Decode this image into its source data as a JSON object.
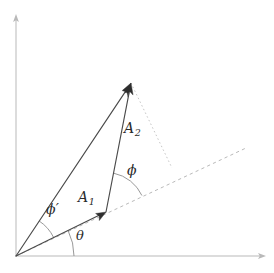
{
  "figure": {
    "type": "vector-diagram",
    "canvas": {
      "width": 274,
      "height": 273
    },
    "background_color": "#ffffff"
  },
  "colors": {
    "axis": "#b9b9b9",
    "vector": "#4a4a4a",
    "arrowhead": "#2e2e2e",
    "dashed_guide": "#b5b5b5",
    "dotted_guide": "#c2c2c2",
    "arc": "#8c8c8c",
    "label_text": "#2b2b2b"
  },
  "axes": {
    "origin": {
      "x": 16,
      "y": 256
    },
    "y_axis": {
      "from": {
        "x": 16,
        "y": 256
      },
      "to": {
        "x": 16,
        "y": 15
      },
      "has_arrow": true
    },
    "x_axis": {
      "from": {
        "x": 16,
        "y": 256
      },
      "to": {
        "x": 265,
        "y": 256
      },
      "has_arrow": true
    }
  },
  "vectors": [
    {
      "id": "A1",
      "label": "A",
      "subscript": "1",
      "from": {
        "x": 16,
        "y": 256
      },
      "to": {
        "x": 106,
        "y": 212
      },
      "has_arrow": true
    },
    {
      "id": "A2",
      "label": "A",
      "subscript": "2",
      "from": {
        "x": 106,
        "y": 212
      },
      "to": {
        "x": 131,
        "y": 83
      },
      "has_arrow": true
    },
    {
      "id": "resultant",
      "label": "",
      "subscript": "",
      "from": {
        "x": 16,
        "y": 256
      },
      "to": {
        "x": 131,
        "y": 83
      },
      "has_arrow": true
    }
  ],
  "guides": [
    {
      "id": "dashed-extension-of-A1",
      "style": "dashed",
      "from": {
        "x": 16,
        "y": 256
      },
      "to": {
        "x": 246,
        "y": 148
      }
    },
    {
      "id": "dotted-drop-from-tip",
      "style": "dotted",
      "from": {
        "x": 131,
        "y": 83
      },
      "to": {
        "x": 172,
        "y": 168
      }
    }
  ],
  "angles": [
    {
      "id": "theta",
      "symbol": "θ",
      "prime": false,
      "vertex": {
        "x": 16,
        "y": 256
      },
      "between": [
        "x-axis",
        "A1"
      ],
      "radius": 58,
      "label_position": {
        "x": 76,
        "y": 229
      }
    },
    {
      "id": "phi-prime",
      "symbol": "ϕ",
      "prime": true,
      "vertex": {
        "x": 16,
        "y": 256
      },
      "between": [
        "A1",
        "resultant"
      ],
      "radius": 42,
      "label_position": {
        "x": 46,
        "y": 202
      }
    },
    {
      "id": "phi",
      "symbol": "ϕ",
      "prime": false,
      "vertex": {
        "x": 106,
        "y": 212
      },
      "between": [
        "dashed-extension-of-A1",
        "A2"
      ],
      "radius": 40,
      "label_position": {
        "x": 127,
        "y": 163
      }
    }
  ],
  "labels": {
    "a1": {
      "base": "A",
      "sub": "1"
    },
    "a2": {
      "base": "A",
      "sub": "2"
    },
    "phi": {
      "symbol": "ϕ"
    },
    "phi_prime": {
      "symbol": "ϕ",
      "prime": "′"
    },
    "theta": {
      "symbol": "θ"
    }
  }
}
